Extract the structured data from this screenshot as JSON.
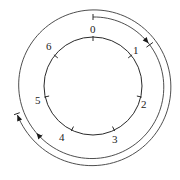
{
  "diagram": {
    "center": [
      93,
      86
    ],
    "inner_radius": 49,
    "positions": [
      {
        "label": "0"
      },
      {
        "label": "1"
      },
      {
        "label": "2"
      },
      {
        "label": "3"
      },
      {
        "label": "4"
      },
      {
        "label": "5"
      },
      {
        "label": "6"
      }
    ],
    "spiral": {
      "start_radius": 69,
      "end_radius": 81,
      "direction": "clockwise",
      "start_angle_deg": 0,
      "end_angle_deg": 610
    },
    "colors": {
      "stroke": "#2a2a2a",
      "background": "#ffffff"
    }
  }
}
